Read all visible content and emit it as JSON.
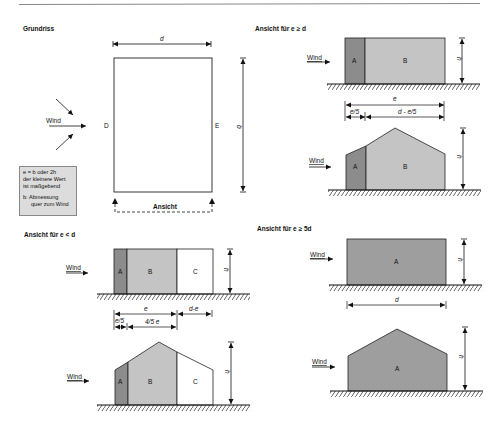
{
  "header": {
    "rule_color": "#8a8a8a"
  },
  "colors": {
    "zone_a": "#8c8c8c",
    "zone_b": "#c4c4c4",
    "zone_c": "#ffffff",
    "zone_a_full": "#9e9e9e",
    "outline": "#222222",
    "note_bg": "#dcdcdc"
  },
  "grundriss": {
    "title": "Grundriss",
    "dim_d": "d",
    "dim_b": "b",
    "side_left": "D",
    "side_right": "E",
    "wind_label": "Wind",
    "view_label": "Ansicht",
    "note": {
      "line1": "e =  b oder 2h",
      "line2": "der kleinere Wert",
      "line3": "ist maßgebend",
      "line4": "b: Abmessung",
      "line5": "quer zum Wind"
    }
  },
  "view_e_ge_d": {
    "title": "Ansicht für e ≥ d",
    "wind_label": "Wind",
    "zone_a": "A",
    "zone_b": "B",
    "dim_h": "h",
    "dim_e": "e",
    "dim_e5": "e/5",
    "dim_rest": "d - e/5"
  },
  "view_e_lt_d": {
    "title": "Ansicht für e < d",
    "wind_label": "Wind",
    "zone_a": "A",
    "zone_b": "B",
    "zone_c": "C",
    "dim_h": "h",
    "dim_e": "e",
    "dim_de": "d-e",
    "dim_e5": "e/5",
    "dim_45e": "4/5 e"
  },
  "view_e_ge_5d": {
    "title": "Ansicht für e ≥ 5d",
    "wind_label": "Wind",
    "zone_a": "A",
    "dim_h": "h",
    "dim_d": "d"
  }
}
